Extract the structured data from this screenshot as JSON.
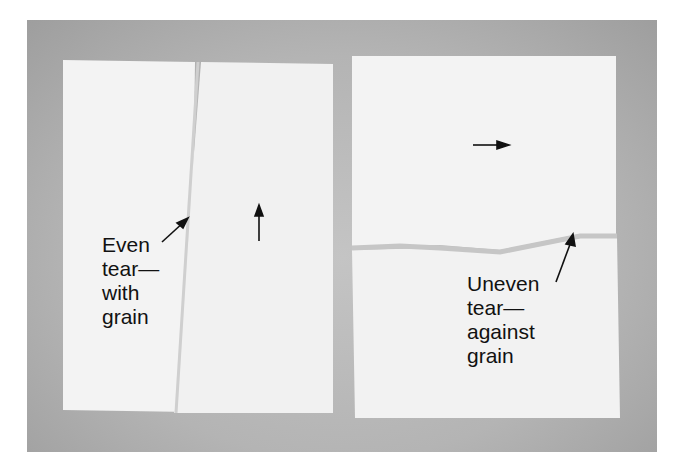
{
  "figure": {
    "left_label": "Even\ntear—\nwith\ngrain",
    "right_label": "Uneven\ntear—\nagainst\ngrain",
    "colors": {
      "background": "#b8b8b8",
      "paper": "#f3f3f3",
      "text": "#111111"
    }
  }
}
